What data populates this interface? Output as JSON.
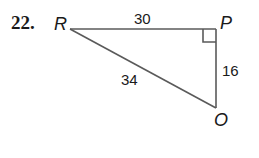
{
  "problem": {
    "number": "22."
  },
  "triangle": {
    "vertices": {
      "R": {
        "label": "R"
      },
      "P": {
        "label": "P"
      },
      "O": {
        "label": "O"
      }
    },
    "sides": {
      "RP": "30",
      "PO": "16",
      "RO": "34"
    },
    "right_angle_at": "P",
    "line_color": "#5a5a5a"
  }
}
